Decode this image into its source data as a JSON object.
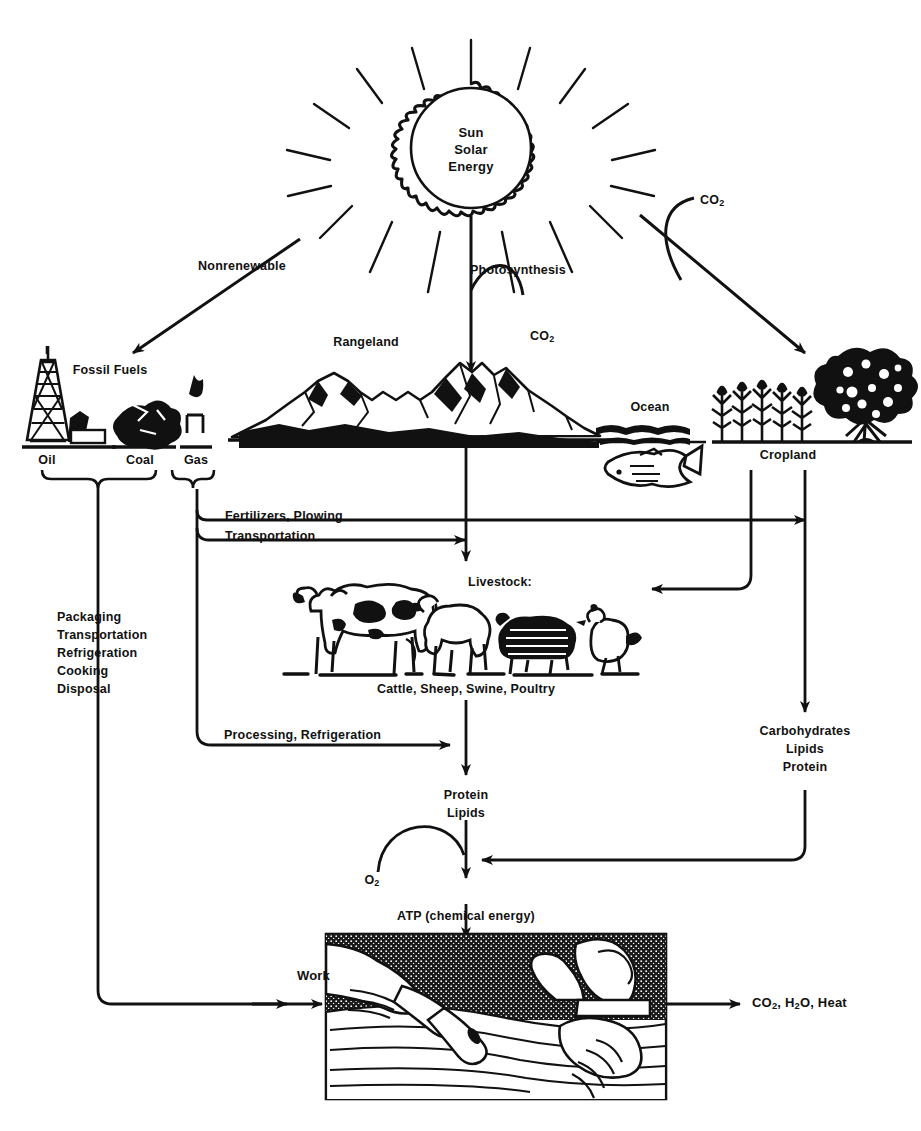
{
  "colors": {
    "ink": "#111111",
    "paper": "#ffffff"
  },
  "nodes": {
    "sun": {
      "line1": "Sun",
      "line2": "Solar",
      "line3": "Energy",
      "icon": "sun-icon"
    },
    "fossil_fuels": {
      "label": "Fossil Fuels",
      "items": [
        "Oil",
        "Coal",
        "Gas"
      ]
    },
    "rangeland": {
      "label": "Rangeland",
      "icon": "mountains-icon"
    },
    "ocean": {
      "label": "Ocean",
      "icon": "fish-icon"
    },
    "cropland": {
      "label": "Cropland",
      "icon": "tree-icon"
    },
    "livestock": {
      "label": "Livestock:",
      "caption": "Cattle, Sheep, Swine, Poultry",
      "icon": "livestock-icon"
    },
    "protein_lipids": {
      "line1": "Protein",
      "line2": "Lipids"
    },
    "carbohydrates": {
      "line1": "Carbohydrates",
      "line2": "Lipids",
      "line3": "Protein"
    },
    "atp": {
      "label": "ATP (chemical energy)"
    },
    "work_image": {
      "label": "Work",
      "icon": "hands-working-icon"
    }
  },
  "flows": {
    "nonrenewable": "Nonrenewable",
    "photosynthesis": "Photosynthesis",
    "co2_top": "CO₂",
    "co2_rangeland": "CO₂",
    "fertilizers_plowing": "Fertilizers, Plowing",
    "transportation": "Transportation",
    "processing_refrigeration": "Processing, Refrigeration",
    "oxygen": "O₂",
    "outputs": "CO₂, H₂O, Heat"
  },
  "household_uses": {
    "lines": [
      "Packaging",
      "Transportation",
      "Refrigeration",
      "Cooking",
      "Disposal"
    ]
  }
}
